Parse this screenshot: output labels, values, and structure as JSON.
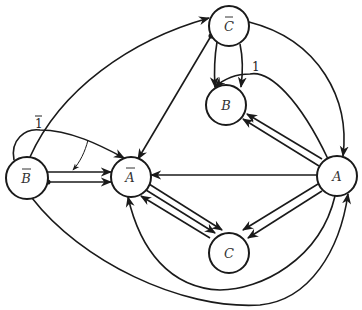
{
  "diagram": {
    "type": "directed-state-graph",
    "background": "#ffffff",
    "stroke_color": "#1a1a1a",
    "nodes": [
      {
        "id": "Cbar",
        "label": "C",
        "overbar": true,
        "x": 229,
        "y": 26,
        "r": 20
      },
      {
        "id": "B",
        "label": "B",
        "overbar": false,
        "x": 226,
        "y": 105,
        "r": 20
      },
      {
        "id": "Bbar",
        "label": "B",
        "overbar": true,
        "x": 27,
        "y": 178,
        "r": 21
      },
      {
        "id": "Abar",
        "label": "A",
        "overbar": true,
        "x": 131,
        "y": 177,
        "r": 20
      },
      {
        "id": "A",
        "label": "A",
        "overbar": false,
        "x": 337,
        "y": 176,
        "r": 20
      },
      {
        "id": "C",
        "label": "C",
        "overbar": false,
        "x": 229,
        "y": 243,
        "r": 20
      }
    ],
    "edges": [
      {
        "from": "Bbar",
        "to": "Cbar",
        "style": "curve"
      },
      {
        "from": "Cbar",
        "to": "Abar",
        "style": "straight"
      },
      {
        "from": "Cbar",
        "to": "B",
        "style": "straight",
        "count": 2
      },
      {
        "from": "Cbar",
        "to": "A",
        "style": "curve"
      },
      {
        "from": "A",
        "to": "B",
        "style": "curve",
        "label": "1"
      },
      {
        "from": "A",
        "to": "B",
        "style": "straight",
        "count": 2
      },
      {
        "from": "A",
        "to": "Abar",
        "style": "straight"
      },
      {
        "from": "A",
        "to": "C",
        "style": "straight",
        "count": 2
      },
      {
        "from": "Abar",
        "to": "C",
        "style": "straight",
        "count": 2
      },
      {
        "from": "C",
        "to": "Abar",
        "style": "straight"
      },
      {
        "from": "Bbar",
        "to": "Abar",
        "style": "straight",
        "count": 2
      },
      {
        "from": "Bbar",
        "to": "Abar",
        "style": "loop-curve",
        "label": "1",
        "label_overbar": true
      },
      {
        "from": "A",
        "to": "Abar",
        "style": "curve-bottom"
      },
      {
        "from": "Bbar",
        "to": "A",
        "style": "curve-bottom"
      }
    ],
    "edge_labels": [
      {
        "text": "1",
        "overbar": true,
        "x": 38,
        "y": 124
      },
      {
        "text": "1",
        "overbar": false,
        "x": 256,
        "y": 71
      }
    ]
  }
}
